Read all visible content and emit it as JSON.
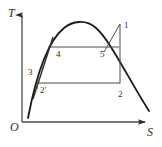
{
  "figure": {
    "kind": "ts-diagram",
    "background_color": "#ffffff",
    "line_color": "#2b2b2b",
    "dome_color": "#1a1a1a"
  },
  "axes": {
    "y_label": "T",
    "x_label": "S",
    "origin_label": "O",
    "x_axis": {
      "start": [
        22,
        122
      ],
      "end": [
        150,
        122
      ]
    },
    "y_axis": {
      "start": [
        22,
        122
      ],
      "end": [
        22,
        12
      ]
    }
  },
  "dome": {
    "name": "saturation-dome",
    "left_end": [
      28,
      118
    ],
    "peak": [
      82,
      23
    ],
    "right_end": [
      149,
      111
    ]
  },
  "states": [
    {
      "id": "1",
      "label": "1",
      "label_x": 124,
      "label_y": 21
    },
    {
      "id": "2",
      "label": "2",
      "label_x": 118,
      "label_y": 90
    },
    {
      "id": "2p",
      "label": "2′",
      "label_x": 40,
      "label_y": 86
    },
    {
      "id": "3",
      "label": "3",
      "label_x": 28,
      "label_y": 68
    },
    {
      "id": "4",
      "label": "4",
      "label_x": 56,
      "label_y": 50
    },
    {
      "id": "5",
      "label": "5",
      "label_x": 100,
      "label_y": 50
    }
  ],
  "process_lines": [
    {
      "name": "line-4-5-isotherm-upper",
      "from": [
        48,
        47
      ],
      "to": [
        118,
        47
      ]
    },
    {
      "name": "line-2p-2-isotherm-lower",
      "from": [
        38,
        83
      ],
      "to": [
        120,
        83
      ]
    },
    {
      "name": "line-2-vertical",
      "from": [
        120,
        83
      ],
      "to": [
        120,
        24
      ]
    },
    {
      "name": "line-5-to-1",
      "from": [
        105,
        51
      ],
      "to": [
        120,
        24
      ]
    },
    {
      "name": "line-3-steep",
      "from": [
        34,
        97
      ],
      "to": [
        52,
        38
      ]
    },
    {
      "name": "line-2p-drop",
      "from": [
        38,
        83
      ],
      "to": [
        38,
        92
      ]
    }
  ]
}
